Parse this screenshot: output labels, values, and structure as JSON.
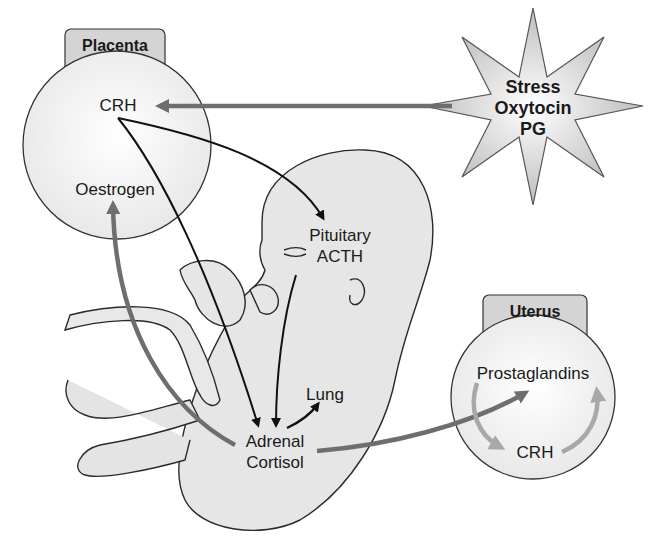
{
  "diagram": {
    "placenta": {
      "title": "Placenta",
      "crh": "CRH",
      "oestrogen": "Oestrogen"
    },
    "stimuli": {
      "line1": "Stress",
      "line2": "Oxytocin",
      "line3": "PG"
    },
    "fetus": {
      "pituitary": "Pituitary",
      "acth": "ACTH",
      "lung": "Lung",
      "adrenal": "Adrenal",
      "cortisol": "Cortisol"
    },
    "uterus": {
      "title": "Uterus",
      "prostaglandins": "Prostaglandins",
      "crh": "CRH"
    },
    "colors": {
      "black_arrow": "#111111",
      "grey_arrow": "#6e6e6e",
      "light_arrow": "#a8a8a8",
      "tab_fill": "#d4d4d4",
      "body_fill": "#e6e6e6"
    }
  }
}
